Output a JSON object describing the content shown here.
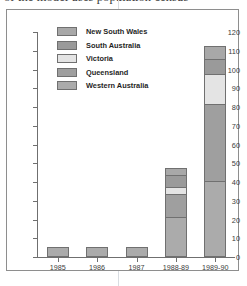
{
  "title": {
    "text": "of the model uses population census",
    "clipped": true
  },
  "chart_data": {
    "type": "bar",
    "stacked": true,
    "title": "of the model uses population census",
    "xlabel": "",
    "ylabel": "",
    "ylim": [
      0,
      120
    ],
    "ytick_step": 10,
    "yticks": [
      0,
      10,
      20,
      30,
      40,
      50,
      60,
      70,
      80,
      90,
      100,
      110,
      120
    ],
    "grid": false,
    "legend_position": "top-left-inside",
    "categories": [
      "1985",
      "1986",
      "1987",
      "1988-89",
      "1989-90"
    ],
    "series": [
      {
        "name": "New South Wales",
        "color": "#a8a8a8",
        "values": [
          0,
          0,
          0,
          4,
          7
        ]
      },
      {
        "name": "South Australia",
        "color": "#9a9a9a",
        "values": [
          0,
          0,
          0,
          6,
          8
        ]
      },
      {
        "name": "Victoria",
        "color": "#e4e4e4",
        "values": [
          0,
          0,
          0,
          4,
          16
        ]
      },
      {
        "name": "Queensland",
        "color": "#9f9f9f",
        "values": [
          0,
          0,
          0,
          12,
          41
        ]
      },
      {
        "name": "Western Australia",
        "color": "#ababab",
        "values": [
          5,
          5,
          5,
          21,
          40
        ]
      }
    ],
    "totals": [
      5,
      5,
      5,
      47,
      112
    ]
  },
  "legend": {
    "items": [
      {
        "label": "New South Wales"
      },
      {
        "label": "South Australia"
      },
      {
        "label": "Victoria"
      },
      {
        "label": "Queensland"
      },
      {
        "label": "Western Australia"
      }
    ]
  }
}
